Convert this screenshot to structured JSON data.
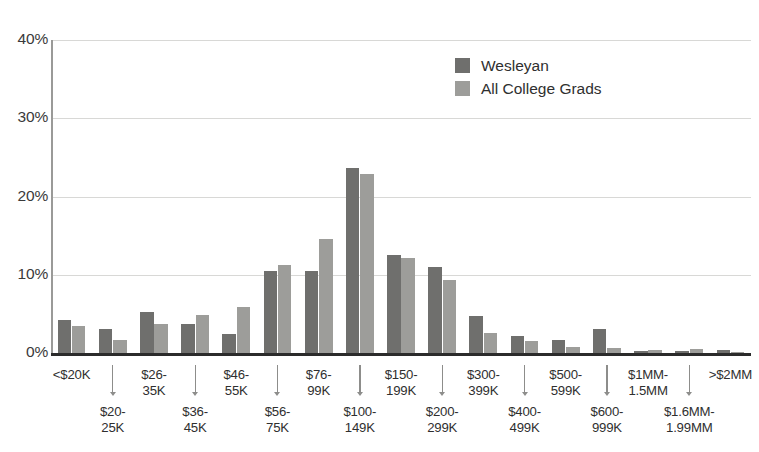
{
  "chart_data": {
    "type": "bar",
    "title": "",
    "xlabel": "",
    "ylabel": "",
    "ylim": [
      0,
      40
    ],
    "yticks": [
      "0%",
      "10%",
      "20%",
      "30%",
      "40%"
    ],
    "ytick_values": [
      0,
      10,
      20,
      30,
      40
    ],
    "grid": true,
    "legend_position": "top-center-right",
    "categories": [
      "<$20K",
      "$20-\n25K",
      "$26-\n35K",
      "$36-\n45K",
      "$46-\n55K",
      "$56-\n75K",
      "$76-\n99K",
      "$100-\n149K",
      "$150-\n199K",
      "$200-\n299K",
      "$300-\n399K",
      "$400-\n499K",
      "$500-\n599K",
      "$600-\n999K",
      "$1MM-\n1.5MM",
      "$1.6MM-\n1.99MM",
      ">$2MM"
    ],
    "category_labels": [
      {
        "line1": "<$20K",
        "line2": "",
        "row": "top"
      },
      {
        "line1": "$20-",
        "line2": "25K",
        "row": "bottom"
      },
      {
        "line1": "$26-",
        "line2": "35K",
        "row": "top"
      },
      {
        "line1": "$36-",
        "line2": "45K",
        "row": "bottom"
      },
      {
        "line1": "$46-",
        "line2": "55K",
        "row": "top"
      },
      {
        "line1": "$56-",
        "line2": "75K",
        "row": "bottom"
      },
      {
        "line1": "$76-",
        "line2": "99K",
        "row": "top"
      },
      {
        "line1": "$100-",
        "line2": "149K",
        "row": "bottom"
      },
      {
        "line1": "$150-",
        "line2": "199K",
        "row": "top"
      },
      {
        "line1": "$200-",
        "line2": "299K",
        "row": "bottom"
      },
      {
        "line1": "$300-",
        "line2": "399K",
        "row": "top"
      },
      {
        "line1": "$400-",
        "line2": "499K",
        "row": "bottom"
      },
      {
        "line1": "$500-",
        "line2": "599K",
        "row": "top"
      },
      {
        "line1": "$600-",
        "line2": "999K",
        "row": "bottom"
      },
      {
        "line1": "$1MM-",
        "line2": "1.5MM",
        "row": "top"
      },
      {
        "line1": "$1.6MM-",
        "line2": "1.99MM",
        "row": "bottom"
      },
      {
        "line1": ">$2MM",
        "line2": "",
        "row": "top"
      }
    ],
    "series": [
      {
        "name": "Wesleyan",
        "color": "#6f6f6d",
        "values": [
          4.2,
          3.1,
          5.2,
          3.7,
          2.4,
          10.5,
          10.5,
          23.7,
          12.5,
          11.0,
          4.7,
          2.2,
          1.6,
          3.1,
          0.2,
          0.2,
          0.4
        ]
      },
      {
        "name": "All College Grads",
        "color": "#9d9d9a",
        "values": [
          3.4,
          1.7,
          3.7,
          4.9,
          5.9,
          11.2,
          14.6,
          22.9,
          12.1,
          9.3,
          2.6,
          1.5,
          0.8,
          0.7,
          0.4,
          0.5,
          0.1
        ]
      }
    ]
  },
  "legend": {
    "items": [
      {
        "label": "Wesleyan",
        "color": "#6f6f6d"
      },
      {
        "label": "All College Grads",
        "color": "#9d9d9a"
      }
    ]
  },
  "axis": {
    "y_ticks": [
      {
        "label": "40%",
        "value": 40
      },
      {
        "label": "30%",
        "value": 30
      },
      {
        "label": "20%",
        "value": 20
      },
      {
        "label": "10%",
        "value": 10
      },
      {
        "label": "0%",
        "value": 0
      }
    ]
  },
  "colors": {
    "series_wesleyan": "#6f6f6d",
    "series_all_grads": "#9d9d9a",
    "gridline": "#d8d8d6",
    "baseline": "#2b2b2b",
    "text": "#2f2f2f",
    "background": "#ffffff"
  }
}
